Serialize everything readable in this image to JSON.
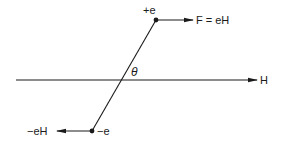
{
  "diagram": {
    "type": "dipole-in-field",
    "colors": {
      "ink": "#1a1a1a",
      "background": "#ffffff"
    },
    "field_line": {
      "label": "H",
      "direction": "right"
    },
    "angle": {
      "label": "θ"
    },
    "positive_charge": {
      "label": "+e",
      "force_label": "F = eH",
      "force_direction": "right"
    },
    "negative_charge": {
      "label": "−e",
      "force_label": "−eH",
      "force_direction": "left"
    }
  }
}
